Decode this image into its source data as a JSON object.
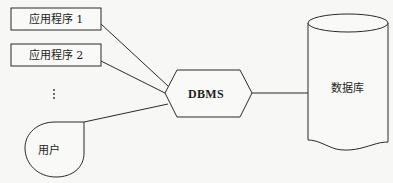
{
  "diagram": {
    "type": "database-system-architecture",
    "nodes": [
      {
        "id": "app1",
        "label": "应用程序 1",
        "shape": "rectangle"
      },
      {
        "id": "app2",
        "label": "应用程序 2",
        "shape": "rectangle"
      },
      {
        "id": "more",
        "label": "⋮",
        "shape": "ellipsis"
      },
      {
        "id": "user",
        "label": "用户",
        "shape": "teardrop"
      },
      {
        "id": "dbms",
        "label": "DBMS",
        "shape": "hexagon"
      },
      {
        "id": "db",
        "label": "数据库",
        "shape": "cylinder"
      }
    ],
    "edges": [
      {
        "from": "app1",
        "to": "dbms"
      },
      {
        "from": "app2",
        "to": "dbms"
      },
      {
        "from": "user",
        "to": "dbms"
      },
      {
        "from": "dbms",
        "to": "db"
      }
    ]
  },
  "colors": {
    "stroke": "#2a2a2a",
    "background": "#f7f7f5",
    "text": "#1e1e1e"
  }
}
